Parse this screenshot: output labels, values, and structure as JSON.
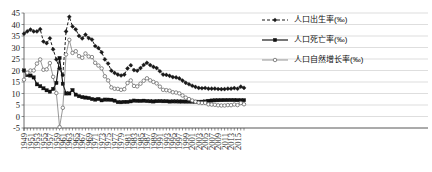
{
  "chart_data": {
    "type": "line",
    "title": "",
    "xlabel": "",
    "ylabel": "",
    "ylim": [
      -5,
      45
    ],
    "ytick_step": 5,
    "yticks": [
      "45",
      "40",
      "35",
      "30",
      "25",
      "20",
      "15",
      "10",
      "5",
      "0",
      "-5"
    ],
    "grid": true,
    "legend_position": "right",
    "xtick_step": 2,
    "x_start": 1949,
    "x_end": 2017,
    "x": [
      1949,
      1950,
      1951,
      1952,
      1953,
      1954,
      1955,
      1956,
      1957,
      1958,
      1959,
      1960,
      1961,
      1962,
      1963,
      1964,
      1965,
      1966,
      1967,
      1968,
      1969,
      1970,
      1971,
      1972,
      1973,
      1974,
      1975,
      1976,
      1977,
      1978,
      1979,
      1980,
      1981,
      1982,
      1983,
      1984,
      1985,
      1986,
      1987,
      1988,
      1989,
      1990,
      1991,
      1992,
      1993,
      1994,
      1995,
      1996,
      1997,
      1998,
      1999,
      2000,
      2001,
      2002,
      2003,
      2004,
      2005,
      2006,
      2007,
      2008,
      2009,
      2010,
      2011,
      2012,
      2013,
      2014,
      2015,
      2016,
      2017
    ],
    "xticks": [
      "1949",
      "1951",
      "1953",
      "1955",
      "1957",
      "1959",
      "1961",
      "1963",
      "1965",
      "1967",
      "1969",
      "1971",
      "1973",
      "1975",
      "1977",
      "1979",
      "1981",
      "1983",
      "1985",
      "1987",
      "1989",
      "1991",
      "1993",
      "1995",
      "1997",
      "1999",
      "2001",
      "2003",
      "2005",
      "2007",
      "2009",
      "2011",
      "2013",
      "2015"
    ],
    "series": [
      {
        "name": "人口出生率(‰)",
        "key": "birth",
        "style": "dashed",
        "marker": "filled-diamond",
        "color": "#1a1a1a",
        "values": [
          36.0,
          37.0,
          37.8,
          37.0,
          37.0,
          37.97,
          32.6,
          31.9,
          34.03,
          29.22,
          24.78,
          20.86,
          18.02,
          37.01,
          43.37,
          39.14,
          37.88,
          35.05,
          33.96,
          35.59,
          34.11,
          33.43,
          30.65,
          29.77,
          27.93,
          24.82,
          23.01,
          19.91,
          18.93,
          18.25,
          17.82,
          18.21,
          20.91,
          22.28,
          20.19,
          19.9,
          21.04,
          22.43,
          23.33,
          22.37,
          21.58,
          21.06,
          19.68,
          18.24,
          18.09,
          17.7,
          17.12,
          16.98,
          16.57,
          15.64,
          14.64,
          14.03,
          13.38,
          12.86,
          12.41,
          12.29,
          12.4,
          12.09,
          12.1,
          12.14,
          11.95,
          11.9,
          11.93,
          12.1,
          12.08,
          12.37,
          12.07,
          12.95,
          12.43
        ]
      },
      {
        "name": "人口死亡率(‰)",
        "key": "death",
        "style": "solid",
        "marker": "filled-square",
        "color": "#111111",
        "values": [
          20.0,
          18.0,
          17.8,
          17.0,
          14.0,
          13.18,
          12.28,
          11.4,
          10.8,
          11.98,
          14.59,
          25.43,
          14.24,
          10.02,
          10.04,
          11.5,
          9.5,
          8.83,
          8.43,
          8.21,
          8.03,
          7.6,
          7.32,
          7.61,
          7.04,
          7.34,
          7.32,
          7.25,
          6.87,
          6.25,
          6.21,
          6.34,
          6.36,
          6.6,
          6.9,
          6.82,
          6.78,
          6.86,
          6.72,
          6.64,
          6.54,
          6.67,
          6.7,
          6.64,
          6.64,
          6.49,
          6.57,
          6.56,
          6.51,
          6.5,
          6.46,
          6.45,
          6.43,
          6.41,
          6.4,
          6.42,
          6.51,
          6.81,
          6.93,
          7.06,
          7.08,
          7.11,
          7.14,
          7.15,
          7.16,
          7.16,
          7.11,
          7.09,
          7.11
        ]
      },
      {
        "name": "人口自然增长率(‰)",
        "key": "growth",
        "style": "thin-solid",
        "marker": "open-circle",
        "color": "#6b6b6b",
        "values": [
          16.0,
          19.0,
          20.0,
          20.0,
          23.0,
          24.79,
          20.32,
          20.5,
          23.23,
          17.24,
          10.19,
          -4.57,
          3.78,
          26.99,
          33.33,
          27.64,
          28.38,
          26.22,
          25.53,
          27.38,
          26.08,
          25.83,
          23.33,
          22.16,
          20.89,
          17.48,
          15.69,
          12.66,
          12.06,
          12.0,
          11.61,
          11.87,
          14.55,
          15.68,
          13.29,
          13.08,
          14.26,
          15.57,
          16.61,
          15.73,
          15.04,
          14.39,
          12.98,
          11.6,
          11.45,
          11.21,
          10.55,
          10.42,
          10.06,
          9.14,
          8.18,
          7.58,
          6.95,
          6.45,
          6.01,
          5.87,
          5.89,
          5.28,
          5.17,
          5.08,
          4.87,
          4.79,
          4.79,
          4.95,
          4.92,
          5.21,
          4.96,
          5.86,
          5.32
        ]
      }
    ]
  },
  "legend": {
    "items": [
      {
        "label": "人口出生率(‰)"
      },
      {
        "label": "人口死亡率(‰)"
      },
      {
        "label": "人口自然增长率(‰)"
      }
    ]
  }
}
